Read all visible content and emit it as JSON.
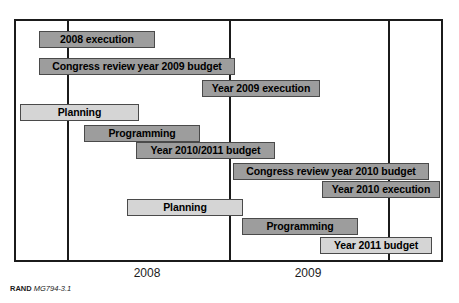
{
  "figure": {
    "credit_org": "RAND",
    "credit_id": "MG794-3.1"
  },
  "chart_data": {
    "type": "bar",
    "title": "",
    "subtitle": "",
    "xlabel": "",
    "ylabel": "",
    "orientation": "horizontal",
    "chart_style": "gantt",
    "grid": true,
    "legend": false,
    "legend_position": "none",
    "colors": {
      "bar_dark": "#9d9d9d",
      "bar_light": "#d5d5d5",
      "bar_border": "#4a4a4a",
      "frame": "#1b1b1b",
      "text": "#000000",
      "background": "#ffffff"
    },
    "x_axis": {
      "tick_labels": [
        "2008",
        "2009"
      ],
      "tick_label_centers_px": [
        147,
        308
      ],
      "gridline_positions_px": [
        66,
        228,
        387
      ],
      "axis_start_px": 14,
      "axis_end_px": 443
    },
    "categories": [
      "2008 execution",
      "Congress review year 2009 budget",
      "Year 2009 execution",
      "Planning",
      "Programming",
      "Year 2010/2011 budget",
      "Congress review year 2010 budget",
      "Year 2010 execution",
      "Planning",
      "Programming",
      "Year 2011 budget"
    ],
    "bars": [
      {
        "label": "2008 execution",
        "row": 1,
        "shade": "dark",
        "x_start_px": 39,
        "x_end_px": 155,
        "y_px": 31
      },
      {
        "label": "Congress review year 2009 budget",
        "row": 2,
        "shade": "dark",
        "x_start_px": 39,
        "x_end_px": 235,
        "y_px": 58
      },
      {
        "label": "Year 2009 execution",
        "row": 3,
        "shade": "dark",
        "x_start_px": 202,
        "x_end_px": 320,
        "y_px": 80
      },
      {
        "label": "Planning",
        "row": 4,
        "shade": "light",
        "x_start_px": 20,
        "x_end_px": 139,
        "y_px": 104
      },
      {
        "label": "Programming",
        "row": 5,
        "shade": "dark",
        "x_start_px": 84,
        "x_end_px": 200,
        "y_px": 125
      },
      {
        "label": "Year 2010/2011 budget",
        "row": 6,
        "shade": "dark",
        "x_start_px": 136,
        "x_end_px": 275,
        "y_px": 142
      },
      {
        "label": "Congress review year 2010 budget",
        "row": 7,
        "shade": "dark",
        "x_start_px": 233,
        "x_end_px": 429,
        "y_px": 163
      },
      {
        "label": "Year 2010 execution",
        "row": 8,
        "shade": "dark",
        "x_start_px": 322,
        "x_end_px": 440,
        "y_px": 181
      },
      {
        "label": "Planning",
        "row": 9,
        "shade": "light",
        "x_start_px": 127,
        "x_end_px": 243,
        "y_px": 199
      },
      {
        "label": "Programming",
        "row": 10,
        "shade": "dark",
        "x_start_px": 242,
        "x_end_px": 358,
        "y_px": 218
      },
      {
        "label": "Year 2011 budget",
        "row": 11,
        "shade": "light",
        "x_start_px": 320,
        "x_end_px": 432,
        "y_px": 237
      }
    ]
  }
}
